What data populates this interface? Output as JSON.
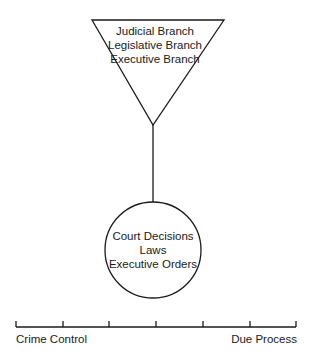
{
  "diagram": {
    "source_node": {
      "shape": "inverted-triangle",
      "lines": [
        "Judicial Branch",
        "Legislative Branch",
        "Executive Branch"
      ]
    },
    "output_node": {
      "shape": "circle",
      "lines": [
        "Court Decisions",
        "Laws",
        "Executive Orders"
      ]
    },
    "connector": "vertical line from triangle apex to circle",
    "scale": {
      "left_label": "Crime Control",
      "right_label": "Due Process",
      "tick_count": 7
    }
  }
}
